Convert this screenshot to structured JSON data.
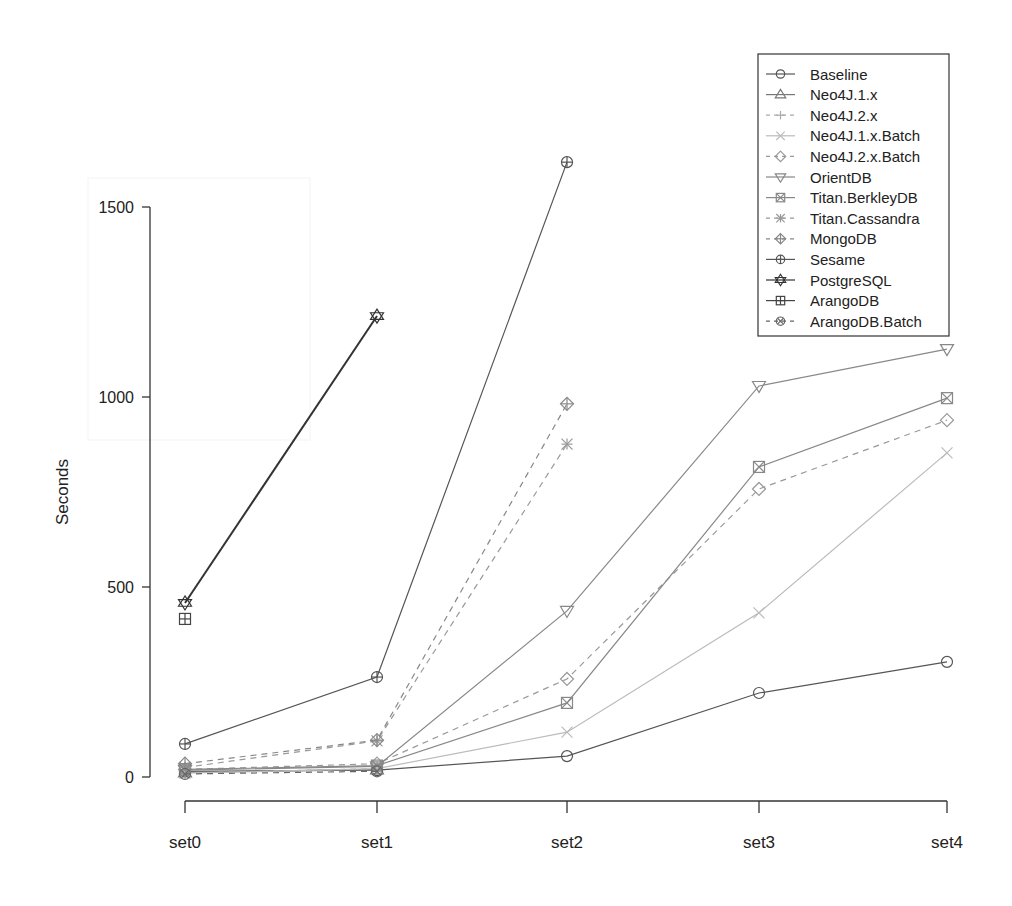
{
  "chart_data": {
    "type": "line",
    "title": "",
    "xlabel": "",
    "ylabel": "Seconds",
    "categories": [
      "set0",
      "set1",
      "set2",
      "set3",
      "set4"
    ],
    "yticks": [
      0,
      500,
      1000,
      1500
    ],
    "ylim": [
      0,
      1650
    ],
    "grid": false,
    "legend_position": "top-right",
    "series": [
      {
        "name": "Baseline",
        "marker": "circle",
        "dash": false,
        "color": "#555555",
        "values": [
          15,
          18,
          55,
          221,
          303
        ]
      },
      {
        "name": "Neo4J.1.x",
        "marker": "triangle-up",
        "dash": false,
        "color": "#777777",
        "values": [
          12,
          20,
          null,
          null,
          null
        ]
      },
      {
        "name": "Neo4J.2.x",
        "marker": "plus",
        "dash": true,
        "color": "#aaaaaa",
        "values": [
          10,
          22,
          null,
          null,
          null
        ]
      },
      {
        "name": "Neo4J.1.x.Batch",
        "marker": "x",
        "dash": false,
        "color": "#bbbbbb",
        "values": [
          10,
          22,
          118,
          432,
          853
        ]
      },
      {
        "name": "Neo4J.2.x.Batch",
        "marker": "diamond",
        "dash": true,
        "color": "#999999",
        "values": [
          20,
          35,
          258,
          758,
          939
        ]
      },
      {
        "name": "OrientDB",
        "marker": "triangle-down",
        "dash": false,
        "color": "#888888",
        "values": [
          18,
          28,
          437,
          1029,
          1126
        ]
      },
      {
        "name": "Titan.BerkleyDB",
        "marker": "square-x",
        "dash": false,
        "color": "#888888",
        "values": [
          20,
          30,
          195,
          816,
          997
        ]
      },
      {
        "name": "Titan.Cassandra",
        "marker": "asterisk",
        "dash": true,
        "color": "#999999",
        "values": [
          25,
          95,
          876,
          null,
          null
        ]
      },
      {
        "name": "MongoDB",
        "marker": "diamond-plus",
        "dash": true,
        "color": "#888888",
        "values": [
          35,
          97,
          982,
          null,
          null
        ]
      },
      {
        "name": "Sesame",
        "marker": "circle-plus",
        "dash": false,
        "color": "#555555",
        "values": [
          87,
          263,
          1618,
          null,
          null
        ]
      },
      {
        "name": "PostgreSQL",
        "marker": "star-of-david",
        "dash": false,
        "color": "#333333",
        "values": [
          458,
          1213,
          null,
          null,
          null
        ]
      },
      {
        "name": "ArangoDB",
        "marker": "square-plus",
        "dash": false,
        "color": "#444444",
        "values": [
          416,
          null,
          null,
          null,
          null
        ]
      },
      {
        "name": "ArangoDB.Batch",
        "marker": "circle-x",
        "dash": true,
        "color": "#666666",
        "values": [
          8,
          15,
          null,
          null,
          null
        ]
      }
    ]
  }
}
